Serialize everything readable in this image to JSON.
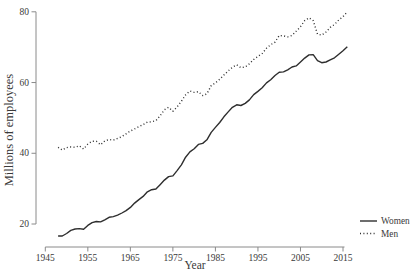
{
  "figure": {
    "background": "#ffffff",
    "axis_color": "#8a8a8a",
    "text_color": "#3a3a3a",
    "line_color": "#2e2e2e"
  },
  "chart_data": {
    "type": "line",
    "title": "",
    "xlabel": "Year",
    "ylabel": "Millions of employees",
    "x_ticks": [
      1945,
      1955,
      1965,
      1975,
      1985,
      1995,
      2005,
      2015
    ],
    "y_ticks": [
      20,
      40,
      60,
      80
    ],
    "xlim": [
      1945,
      2016
    ],
    "ylim": [
      20,
      80
    ],
    "grid": false,
    "legend_position": "bottom-right",
    "x": [
      1948,
      1949,
      1950,
      1951,
      1952,
      1953,
      1954,
      1955,
      1956,
      1957,
      1958,
      1959,
      1960,
      1961,
      1962,
      1963,
      1964,
      1965,
      1966,
      1967,
      1968,
      1969,
      1970,
      1971,
      1972,
      1973,
      1974,
      1975,
      1976,
      1977,
      1978,
      1979,
      1980,
      1981,
      1982,
      1983,
      1984,
      1985,
      1986,
      1987,
      1988,
      1989,
      1990,
      1991,
      1992,
      1993,
      1994,
      1995,
      1996,
      1997,
      1998,
      1999,
      2000,
      2001,
      2002,
      2003,
      2004,
      2005,
      2006,
      2007,
      2008,
      2009,
      2010,
      2011,
      2012,
      2013,
      2014,
      2015,
      2016
    ],
    "series": [
      {
        "name": "Women",
        "style": "solid",
        "values": [
          16.6,
          16.6,
          17.3,
          18.2,
          18.6,
          18.7,
          18.5,
          19.6,
          20.4,
          20.7,
          20.6,
          21.2,
          21.9,
          22.1,
          22.5,
          23.1,
          23.8,
          24.7,
          25.9,
          26.9,
          27.8,
          29.1,
          29.7,
          29.9,
          31.1,
          32.4,
          33.4,
          33.6,
          35.1,
          36.7,
          38.9,
          40.4,
          41.3,
          42.5,
          42.8,
          43.8,
          45.9,
          47.3,
          48.7,
          50.3,
          51.7,
          53.0,
          53.7,
          53.5,
          54.1,
          55.1,
          56.6,
          57.5,
          58.5,
          59.9,
          60.8,
          62.0,
          62.9,
          63.0,
          63.6,
          64.4,
          64.7,
          65.8,
          66.9,
          67.8,
          67.9,
          66.2,
          65.6,
          65.8,
          66.4,
          67.0,
          68.0,
          69.0,
          70.1
        ]
      },
      {
        "name": "Men",
        "style": "dotted",
        "values": [
          41.7,
          40.9,
          41.6,
          41.8,
          41.7,
          42.1,
          41.2,
          42.6,
          43.4,
          43.4,
          42.4,
          43.5,
          43.9,
          43.7,
          44.2,
          44.7,
          45.5,
          46.3,
          46.9,
          47.5,
          48.1,
          48.8,
          48.9,
          49.2,
          50.6,
          52.3,
          53.0,
          51.9,
          53.1,
          54.7,
          56.5,
          57.6,
          57.2,
          57.4,
          56.3,
          56.8,
          59.1,
          59.9,
          60.9,
          62.1,
          63.3,
          64.3,
          65.0,
          64.2,
          64.4,
          65.3,
          66.5,
          67.4,
          68.2,
          69.7,
          70.7,
          71.4,
          73.3,
          73.2,
          72.9,
          73.3,
          74.5,
          75.8,
          77.5,
          78.3,
          77.5,
          73.7,
          73.4,
          74.3,
          75.6,
          76.4,
          77.7,
          78.6,
          80.0
        ]
      }
    ]
  }
}
